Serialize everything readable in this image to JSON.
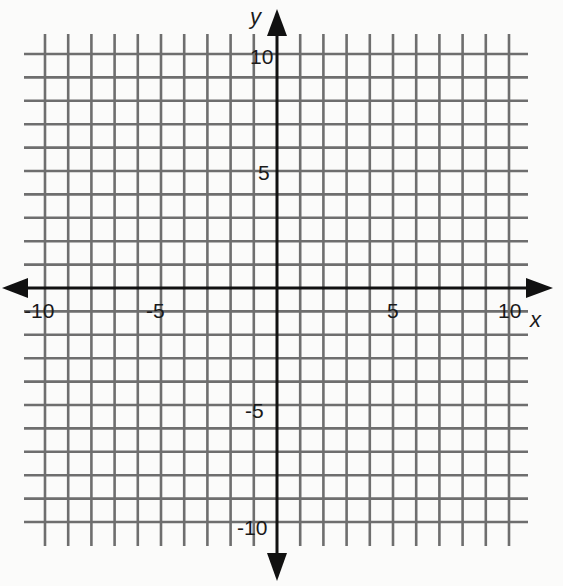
{
  "chart_data": {
    "type": "line",
    "title": "",
    "xlabel": "x",
    "ylabel": "y",
    "xlim": [
      -10,
      10
    ],
    "ylim": [
      -10,
      10
    ],
    "grid": true,
    "grid_step": 1,
    "x_ticks": [
      -10,
      -5,
      5,
      10
    ],
    "y_ticks": [
      10,
      5,
      -5,
      -10
    ],
    "x_tick_labels": [
      "-10",
      "-5",
      "5",
      "10"
    ],
    "y_tick_labels": [
      "10",
      "5",
      "-5",
      "-10"
    ],
    "axes_arrows": true,
    "series": [],
    "legend": null
  },
  "colors": {
    "background": "#fbfbfa",
    "grid": "#6e6e6e",
    "axis": "#111111",
    "text": "#1a1a1a"
  },
  "labels": {
    "x_axis": "x",
    "y_axis": "y",
    "x_neg10": "-10",
    "x_neg5": "-5",
    "x_pos5": "5",
    "x_pos10": "10",
    "y_pos10": "10",
    "y_pos5": "5",
    "y_neg5": "-5",
    "y_neg10": "-10"
  }
}
